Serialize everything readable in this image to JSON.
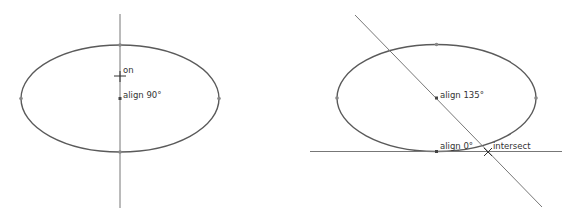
{
  "colors": {
    "ellipse": "#555555",
    "line": "#777777",
    "text": "#333333",
    "background": "#ffffff"
  },
  "left_panel": {
    "labels": {
      "on": "on",
      "align": "align 90°"
    }
  },
  "right_panel": {
    "labels": {
      "align135": "align 135°",
      "align0": "align 0°",
      "intersect": "intersect"
    }
  }
}
